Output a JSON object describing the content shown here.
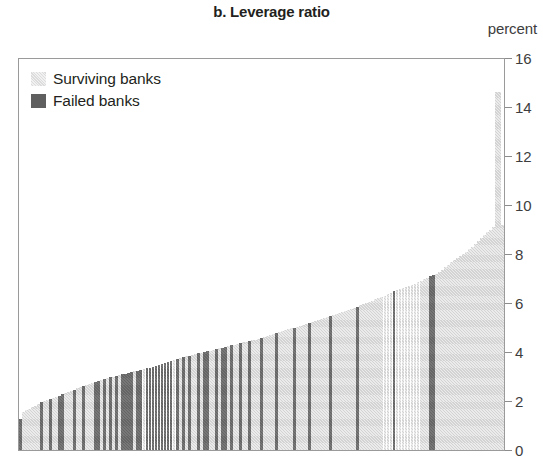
{
  "chart_data": {
    "type": "bar",
    "title": "b. Leverage ratio",
    "subtitle": "",
    "unit_label": "percent",
    "xlabel": "",
    "ylabel": "percent",
    "ylim": [
      0,
      16
    ],
    "yticks": [
      0,
      2,
      4,
      6,
      8,
      10,
      12,
      14,
      16
    ],
    "ytick_labels": [
      "0",
      "2",
      "4",
      "6",
      "8",
      "10",
      "12",
      "14",
      "16"
    ],
    "grid": false,
    "xaxis_ticks": false,
    "legend_position": "top-left",
    "note": "Banks sorted in ascending order of leverage ratio; each bar is one bank.",
    "series": [
      {
        "name": "Surviving banks",
        "key": "surviving",
        "color": "#d3d3d3"
      },
      {
        "name": "Failed banks",
        "key": "failed",
        "color": "#656565"
      }
    ],
    "bar_count": 161,
    "bars": [
      {
        "i": 0,
        "value": 1.25,
        "group": "failed"
      },
      {
        "i": 1,
        "value": 1.55,
        "group": "surviving"
      },
      {
        "i": 2,
        "value": 1.62,
        "group": "surviving"
      },
      {
        "i": 3,
        "value": 1.68,
        "group": "surviving"
      },
      {
        "i": 4,
        "value": 1.74,
        "group": "surviving"
      },
      {
        "i": 5,
        "value": 1.8,
        "group": "surviving"
      },
      {
        "i": 6,
        "value": 1.88,
        "group": "surviving"
      },
      {
        "i": 7,
        "value": 1.95,
        "group": "failed"
      },
      {
        "i": 8,
        "value": 2.0,
        "group": "surviving"
      },
      {
        "i": 9,
        "value": 2.04,
        "group": "surviving"
      },
      {
        "i": 10,
        "value": 2.08,
        "group": "failed"
      },
      {
        "i": 11,
        "value": 2.12,
        "group": "surviving"
      },
      {
        "i": 12,
        "value": 2.16,
        "group": "surviving"
      },
      {
        "i": 13,
        "value": 2.22,
        "group": "failed"
      },
      {
        "i": 14,
        "value": 2.28,
        "group": "failed"
      },
      {
        "i": 15,
        "value": 2.32,
        "group": "surviving"
      },
      {
        "i": 16,
        "value": 2.36,
        "group": "surviving"
      },
      {
        "i": 17,
        "value": 2.4,
        "group": "surviving"
      },
      {
        "i": 18,
        "value": 2.46,
        "group": "failed"
      },
      {
        "i": 19,
        "value": 2.52,
        "group": "surviving"
      },
      {
        "i": 20,
        "value": 2.56,
        "group": "surviving"
      },
      {
        "i": 21,
        "value": 2.6,
        "group": "failed"
      },
      {
        "i": 22,
        "value": 2.64,
        "group": "surviving"
      },
      {
        "i": 23,
        "value": 2.68,
        "group": "surviving"
      },
      {
        "i": 24,
        "value": 2.72,
        "group": "surviving"
      },
      {
        "i": 25,
        "value": 2.76,
        "group": "failed"
      },
      {
        "i": 26,
        "value": 2.8,
        "group": "failed"
      },
      {
        "i": 27,
        "value": 2.84,
        "group": "surviving"
      },
      {
        "i": 28,
        "value": 2.88,
        "group": "failed"
      },
      {
        "i": 29,
        "value": 2.92,
        "group": "surviving"
      },
      {
        "i": 30,
        "value": 2.96,
        "group": "failed"
      },
      {
        "i": 31,
        "value": 3.0,
        "group": "surviving"
      },
      {
        "i": 32,
        "value": 3.03,
        "group": "failed"
      },
      {
        "i": 33,
        "value": 3.06,
        "group": "surviving"
      },
      {
        "i": 34,
        "value": 3.09,
        "group": "failed"
      },
      {
        "i": 35,
        "value": 3.12,
        "group": "failed"
      },
      {
        "i": 36,
        "value": 3.15,
        "group": "failed"
      },
      {
        "i": 37,
        "value": 3.18,
        "group": "failed"
      },
      {
        "i": 38,
        "value": 3.21,
        "group": "surviving"
      },
      {
        "i": 39,
        "value": 3.24,
        "group": "failed"
      },
      {
        "i": 40,
        "value": 3.27,
        "group": "failed"
      },
      {
        "i": 41,
        "value": 3.3,
        "group": "surviving"
      },
      {
        "i": 42,
        "value": 3.33,
        "group": "failed"
      },
      {
        "i": 43,
        "value": 3.36,
        "group": "failed"
      },
      {
        "i": 44,
        "value": 3.4,
        "group": "failed"
      },
      {
        "i": 45,
        "value": 3.44,
        "group": "failed"
      },
      {
        "i": 46,
        "value": 3.48,
        "group": "failed"
      },
      {
        "i": 47,
        "value": 3.52,
        "group": "failed"
      },
      {
        "i": 48,
        "value": 3.56,
        "group": "failed"
      },
      {
        "i": 49,
        "value": 3.6,
        "group": "failed"
      },
      {
        "i": 50,
        "value": 3.64,
        "group": "failed"
      },
      {
        "i": 51,
        "value": 3.68,
        "group": "surviving"
      },
      {
        "i": 52,
        "value": 3.72,
        "group": "failed"
      },
      {
        "i": 53,
        "value": 3.76,
        "group": "surviving"
      },
      {
        "i": 54,
        "value": 3.79,
        "group": "failed"
      },
      {
        "i": 55,
        "value": 3.82,
        "group": "surviving"
      },
      {
        "i": 56,
        "value": 3.85,
        "group": "failed"
      },
      {
        "i": 57,
        "value": 3.88,
        "group": "surviving"
      },
      {
        "i": 58,
        "value": 3.91,
        "group": "surviving"
      },
      {
        "i": 59,
        "value": 3.94,
        "group": "failed"
      },
      {
        "i": 60,
        "value": 3.97,
        "group": "surviving"
      },
      {
        "i": 61,
        "value": 4.0,
        "group": "failed"
      },
      {
        "i": 62,
        "value": 4.03,
        "group": "failed"
      },
      {
        "i": 63,
        "value": 4.06,
        "group": "surviving"
      },
      {
        "i": 64,
        "value": 4.09,
        "group": "surviving"
      },
      {
        "i": 65,
        "value": 4.12,
        "group": "failed"
      },
      {
        "i": 66,
        "value": 4.15,
        "group": "surviving"
      },
      {
        "i": 67,
        "value": 4.18,
        "group": "failed"
      },
      {
        "i": 68,
        "value": 4.21,
        "group": "failed"
      },
      {
        "i": 69,
        "value": 4.24,
        "group": "surviving"
      },
      {
        "i": 70,
        "value": 4.27,
        "group": "failed"
      },
      {
        "i": 71,
        "value": 4.3,
        "group": "surviving"
      },
      {
        "i": 72,
        "value": 4.33,
        "group": "surviving"
      },
      {
        "i": 73,
        "value": 4.36,
        "group": "failed"
      },
      {
        "i": 74,
        "value": 4.39,
        "group": "surviving"
      },
      {
        "i": 75,
        "value": 4.42,
        "group": "surviving"
      },
      {
        "i": 76,
        "value": 4.45,
        "group": "failed"
      },
      {
        "i": 77,
        "value": 4.48,
        "group": "surviving"
      },
      {
        "i": 78,
        "value": 4.51,
        "group": "surviving"
      },
      {
        "i": 79,
        "value": 4.54,
        "group": "surviving"
      },
      {
        "i": 80,
        "value": 4.57,
        "group": "failed"
      },
      {
        "i": 81,
        "value": 4.6,
        "group": "surviving"
      },
      {
        "i": 82,
        "value": 4.64,
        "group": "surviving"
      },
      {
        "i": 83,
        "value": 4.68,
        "group": "surviving"
      },
      {
        "i": 84,
        "value": 4.72,
        "group": "surviving"
      },
      {
        "i": 85,
        "value": 4.76,
        "group": "failed"
      },
      {
        "i": 86,
        "value": 4.8,
        "group": "surviving"
      },
      {
        "i": 87,
        "value": 4.84,
        "group": "surviving"
      },
      {
        "i": 88,
        "value": 4.88,
        "group": "surviving"
      },
      {
        "i": 89,
        "value": 4.92,
        "group": "surviving"
      },
      {
        "i": 90,
        "value": 4.96,
        "group": "surviving"
      },
      {
        "i": 91,
        "value": 5.0,
        "group": "failed"
      },
      {
        "i": 92,
        "value": 5.04,
        "group": "surviving"
      },
      {
        "i": 93,
        "value": 5.08,
        "group": "surviving"
      },
      {
        "i": 94,
        "value": 5.12,
        "group": "surviving"
      },
      {
        "i": 95,
        "value": 5.16,
        "group": "surviving"
      },
      {
        "i": 96,
        "value": 5.2,
        "group": "failed"
      },
      {
        "i": 97,
        "value": 5.24,
        "group": "surviving"
      },
      {
        "i": 98,
        "value": 5.28,
        "group": "surviving"
      },
      {
        "i": 99,
        "value": 5.32,
        "group": "surviving"
      },
      {
        "i": 100,
        "value": 5.36,
        "group": "surviving"
      },
      {
        "i": 101,
        "value": 5.4,
        "group": "surviving"
      },
      {
        "i": 102,
        "value": 5.44,
        "group": "surviving"
      },
      {
        "i": 103,
        "value": 5.48,
        "group": "failed"
      },
      {
        "i": 104,
        "value": 5.52,
        "group": "surviving"
      },
      {
        "i": 105,
        "value": 5.56,
        "group": "surviving"
      },
      {
        "i": 106,
        "value": 5.6,
        "group": "surviving"
      },
      {
        "i": 107,
        "value": 5.64,
        "group": "surviving"
      },
      {
        "i": 108,
        "value": 5.68,
        "group": "surviving"
      },
      {
        "i": 109,
        "value": 5.72,
        "group": "surviving"
      },
      {
        "i": 110,
        "value": 5.76,
        "group": "surviving"
      },
      {
        "i": 111,
        "value": 5.8,
        "group": "surviving"
      },
      {
        "i": 112,
        "value": 5.85,
        "group": "failed"
      },
      {
        "i": 113,
        "value": 5.9,
        "group": "surviving"
      },
      {
        "i": 114,
        "value": 5.95,
        "group": "surviving"
      },
      {
        "i": 115,
        "value": 6.0,
        "group": "surviving"
      },
      {
        "i": 116,
        "value": 6.05,
        "group": "surviving"
      },
      {
        "i": 117,
        "value": 6.1,
        "group": "surviving"
      },
      {
        "i": 118,
        "value": 6.15,
        "group": "surviving"
      },
      {
        "i": 119,
        "value": 6.2,
        "group": "surviving"
      },
      {
        "i": 120,
        "value": 6.25,
        "group": "surviving"
      },
      {
        "i": 121,
        "value": 6.3,
        "group": "surviving"
      },
      {
        "i": 122,
        "value": 6.35,
        "group": "surviving"
      },
      {
        "i": 123,
        "value": 6.42,
        "group": "surviving"
      },
      {
        "i": 124,
        "value": 6.48,
        "group": "failed"
      },
      {
        "i": 125,
        "value": 6.52,
        "group": "surviving"
      },
      {
        "i": 126,
        "value": 6.56,
        "group": "surviving"
      },
      {
        "i": 127,
        "value": 6.6,
        "group": "surviving"
      },
      {
        "i": 128,
        "value": 6.64,
        "group": "surviving"
      },
      {
        "i": 129,
        "value": 6.68,
        "group": "surviving"
      },
      {
        "i": 130,
        "value": 6.72,
        "group": "surviving"
      },
      {
        "i": 131,
        "value": 6.78,
        "group": "surviving"
      },
      {
        "i": 132,
        "value": 6.84,
        "group": "surviving"
      },
      {
        "i": 133,
        "value": 6.9,
        "group": "surviving"
      },
      {
        "i": 134,
        "value": 6.96,
        "group": "surviving"
      },
      {
        "i": 135,
        "value": 7.02,
        "group": "surviving"
      },
      {
        "i": 136,
        "value": 7.1,
        "group": "failed"
      },
      {
        "i": 137,
        "value": 7.14,
        "group": "failed"
      },
      {
        "i": 138,
        "value": 7.2,
        "group": "surviving"
      },
      {
        "i": 139,
        "value": 7.28,
        "group": "surviving"
      },
      {
        "i": 140,
        "value": 7.36,
        "group": "surviving"
      },
      {
        "i": 141,
        "value": 7.46,
        "group": "surviving"
      },
      {
        "i": 142,
        "value": 7.56,
        "group": "surviving"
      },
      {
        "i": 143,
        "value": 7.66,
        "group": "surviving"
      },
      {
        "i": 144,
        "value": 7.76,
        "group": "surviving"
      },
      {
        "i": 145,
        "value": 7.82,
        "group": "surviving"
      },
      {
        "i": 146,
        "value": 7.9,
        "group": "surviving"
      },
      {
        "i": 147,
        "value": 8.0,
        "group": "surviving"
      },
      {
        "i": 148,
        "value": 8.1,
        "group": "surviving"
      },
      {
        "i": 149,
        "value": 8.2,
        "group": "surviving"
      },
      {
        "i": 150,
        "value": 8.3,
        "group": "surviving"
      },
      {
        "i": 151,
        "value": 8.4,
        "group": "surviving"
      },
      {
        "i": 152,
        "value": 8.52,
        "group": "surviving"
      },
      {
        "i": 153,
        "value": 8.64,
        "group": "surviving"
      },
      {
        "i": 154,
        "value": 8.76,
        "group": "surviving"
      },
      {
        "i": 155,
        "value": 8.88,
        "group": "surviving"
      },
      {
        "i": 156,
        "value": 9.0,
        "group": "surviving"
      },
      {
        "i": 157,
        "value": 9.1,
        "group": "surviving"
      },
      {
        "i": 158,
        "value": 14.6,
        "group": "surviving"
      },
      {
        "i": 159,
        "value": 14.6,
        "group": "surviving"
      },
      {
        "i": 160,
        "value": 9.2,
        "group": "surviving"
      }
    ]
  },
  "legend": {
    "items": [
      {
        "label": "Surviving banks",
        "key": "surviving"
      },
      {
        "label": "Failed banks",
        "key": "failed"
      }
    ]
  }
}
